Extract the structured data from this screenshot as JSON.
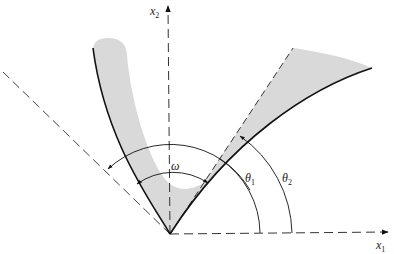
{
  "figure": {
    "type": "geometric-diagram",
    "axes": {
      "x1": {
        "label": "x",
        "subscript": "1"
      },
      "x2": {
        "label": "x",
        "subscript": "2"
      }
    },
    "angles": {
      "omega": {
        "label": "ω"
      },
      "theta1": {
        "label": "θ",
        "subscript": "1"
      },
      "theta2": {
        "label": "θ",
        "subscript": "2"
      }
    },
    "colors": {
      "shade": "#d9d9d9",
      "line": "#1a1a1a",
      "dash": "#333333"
    }
  }
}
